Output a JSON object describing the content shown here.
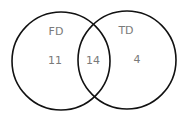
{
  "venn": {
    "sets": [
      {
        "label": "FD",
        "only_count": "11"
      },
      {
        "label": "TD",
        "only_count": "4"
      }
    ],
    "intersection_count": "14",
    "colors": {
      "stroke": "#111111",
      "text": "#7a7a7a"
    }
  }
}
